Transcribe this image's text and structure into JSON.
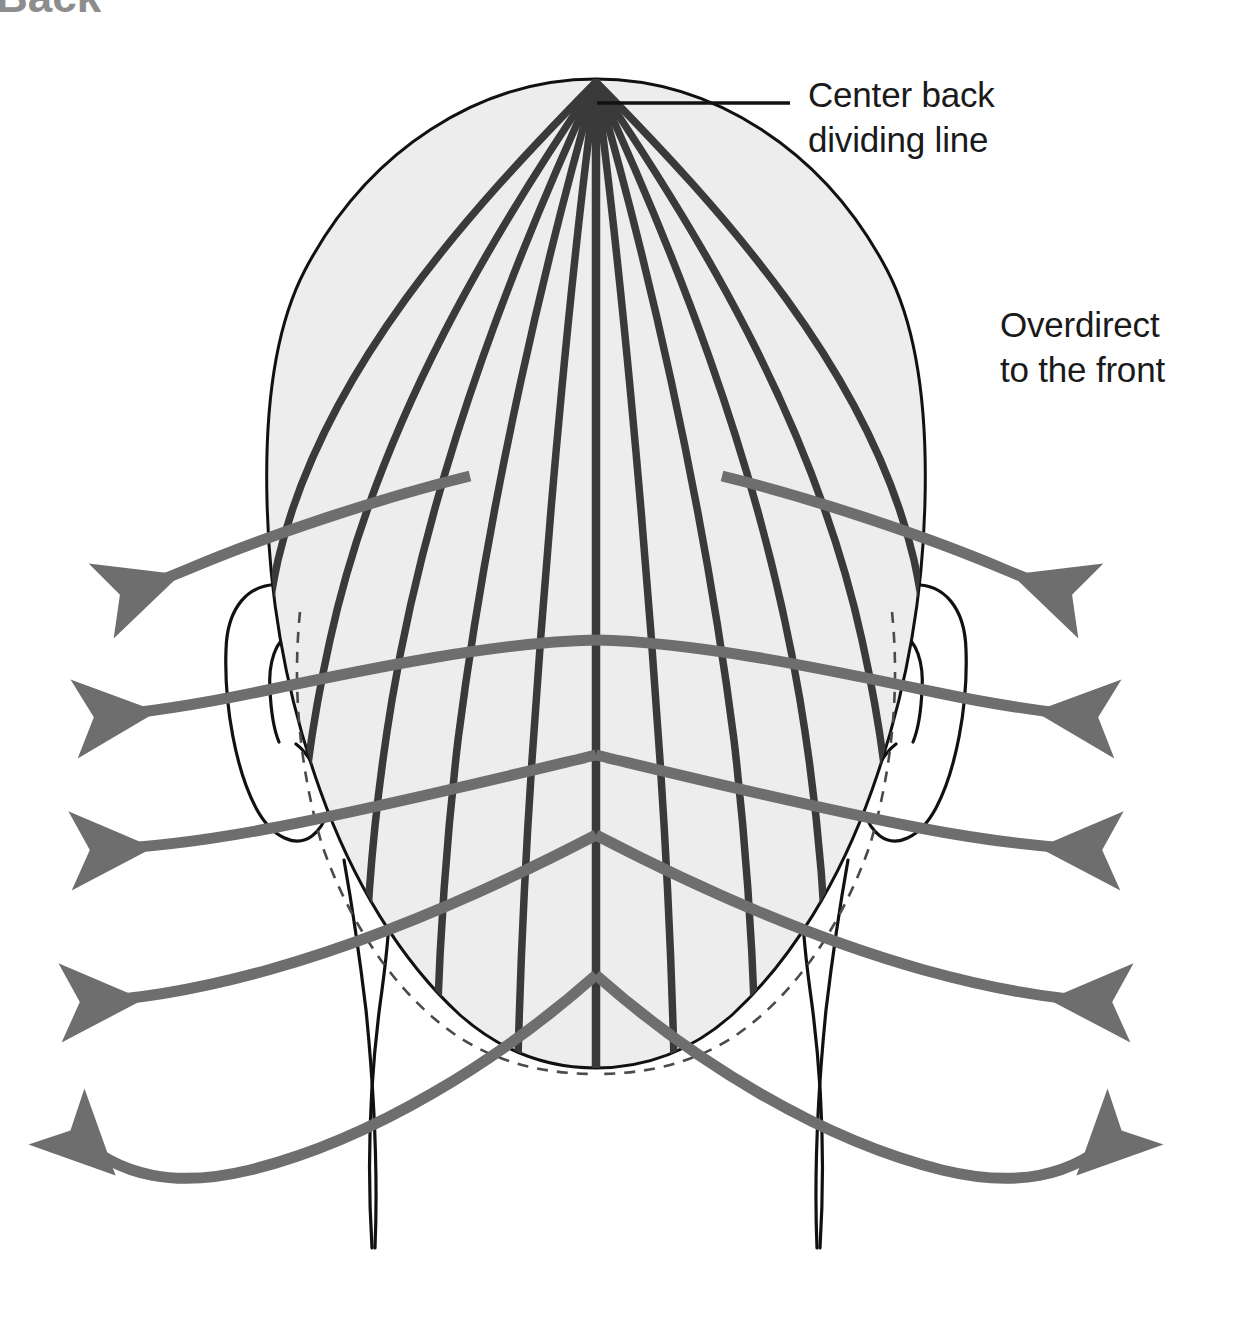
{
  "figure": {
    "title_fragment": "Back",
    "view": "back view of head, top-down"
  },
  "labels": {
    "center_back": {
      "line1": "Center back",
      "line2": "dividing line",
      "x": 808,
      "y": 107
    },
    "overdirect": {
      "line1": "Overdirect",
      "line2": "to the front",
      "x": 1000,
      "y": 337
    }
  },
  "colors": {
    "head_fill": "#ededed",
    "head_outline": "#111111",
    "section_line": "#3a3a3a",
    "arrow": "#6e6e6e",
    "hairline_dash": "#4a4a4a",
    "label_text": "#1a1a1a",
    "background": "#ffffff",
    "cut_title": "#8d8d8d"
  },
  "geometry": {
    "crown_point": {
      "x": 596,
      "y": 81
    },
    "head_center_x": 596,
    "head_left_edge": 267,
    "head_right_edge": 925,
    "head_top": 78,
    "head_bottom": 1068
  },
  "elements": {
    "center_back_dividing_line": "center-back-dividing-line",
    "section_lines_count": 11,
    "arrow_pairs_count": 5,
    "arrow_direction": "outward and forward toward the front",
    "ears": [
      "left-ear",
      "right-ear"
    ],
    "neck_lines": [
      "left-neck-line",
      "right-neck-line"
    ],
    "hairline_style": "dashed"
  },
  "leader": {
    "from_x": 597,
    "from_y": 103,
    "to_x": 790,
    "to_y": 103
  }
}
